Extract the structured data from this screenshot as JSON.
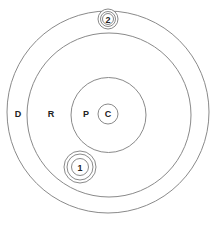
{
  "diagram": {
    "type": "concentric-circles",
    "labels": {
      "outer_ring": "D",
      "middle_ring": "R",
      "inner_circle": "P",
      "core": "C",
      "marker_1": "1",
      "marker_2": "2"
    },
    "colors": {
      "stroke": "#8a8a8a",
      "text": "#222222",
      "background": "#ffffff"
    }
  }
}
